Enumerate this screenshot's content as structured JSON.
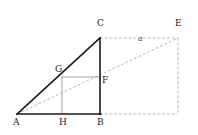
{
  "figure": {
    "kind": "geometry-diagram",
    "width": 198,
    "height": 135,
    "background_color": "#ffffff"
  },
  "colors": {
    "solid_stroke": "#1a1a1a",
    "light_stroke": "#999999",
    "dashed_stroke": "#aaaaaa",
    "label_text": "#1a1a1a",
    "side_label_text": "#555555"
  },
  "points": {
    "A": {
      "label": "A",
      "x": 17,
      "y": 114,
      "label_x": 13,
      "label_y": 118
    },
    "B": {
      "label": "B",
      "x": 100,
      "y": 114,
      "label_x": 97,
      "label_y": 118
    },
    "C": {
      "label": "C",
      "x": 100,
      "y": 38,
      "label_x": 97,
      "label_y": 19
    },
    "E": {
      "label": "E",
      "x": 178,
      "y": 38,
      "label_x": 175,
      "label_y": 19
    },
    "F": {
      "label": "F",
      "x": 100,
      "y": 77,
      "label_x": 102,
      "label_y": 76
    },
    "G": {
      "label": "G",
      "x": 62,
      "y": 77,
      "label_x": 55,
      "label_y": 65
    },
    "H": {
      "label": "H",
      "x": 62,
      "y": 114,
      "label_x": 59,
      "label_y": 118
    }
  },
  "segments": [
    {
      "name": "AB",
      "from": "A",
      "to": "B",
      "style": "solid",
      "weight": 1.6,
      "color": "#1a1a1a"
    },
    {
      "name": "AC",
      "from": "A",
      "to": "C",
      "style": "solid",
      "weight": 1.6,
      "color": "#1a1a1a"
    },
    {
      "name": "CB",
      "from": "C",
      "to": "B",
      "style": "solid",
      "weight": 1.6,
      "color": "#1a1a1a"
    },
    {
      "name": "GF",
      "from": "G",
      "to": "F",
      "style": "solid",
      "weight": 0.9,
      "color": "#999999"
    },
    {
      "name": "HG",
      "from": "H",
      "to": "G",
      "style": "solid",
      "weight": 0.9,
      "color": "#999999"
    },
    {
      "name": "CE",
      "from": "C",
      "to": "E",
      "style": "dashed",
      "weight": 0.9,
      "color": "#aaaaaa"
    },
    {
      "name": "AE",
      "from": "A",
      "to": "E",
      "style": "dashed",
      "weight": 0.9,
      "color": "#aaaaaa"
    },
    {
      "name": "BE-bottom",
      "from": "B",
      "to": "Ebase",
      "style": "dashed",
      "weight": 0.9,
      "color": "#aaaaaa"
    },
    {
      "name": "E-vertical",
      "from": "E",
      "to": "Ebase",
      "style": "dashed",
      "weight": 0.9,
      "color": "#aaaaaa"
    }
  ],
  "side_labels": [
    {
      "name": "a",
      "text": "a",
      "x": 138,
      "y": 35
    }
  ],
  "vertex_order": [
    "A",
    "B",
    "C",
    "E",
    "F",
    "G",
    "H"
  ]
}
